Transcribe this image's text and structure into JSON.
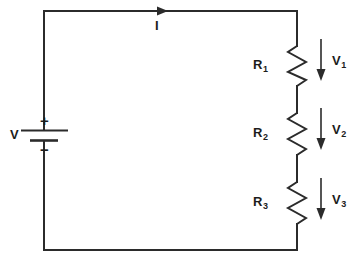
{
  "diagram": {
    "type": "series-resistor-circuit",
    "stroke_color": "#2b2b2b",
    "background": "#ffffff",
    "source": {
      "label": "V",
      "plus_sign": "+",
      "minus_sign": "−",
      "symbol": "battery-cell"
    },
    "current": {
      "label": "I",
      "direction": "right",
      "arrow": "current-arrow-right"
    },
    "components": [
      {
        "label": "R",
        "subscript": "1",
        "type": "resistor"
      },
      {
        "label": "R",
        "subscript": "2",
        "type": "resistor"
      },
      {
        "label": "R",
        "subscript": "3",
        "type": "resistor"
      }
    ],
    "voltage_drops": [
      {
        "label": "V",
        "subscript": "1",
        "direction": "down",
        "arrow": "voltage-arrow-down"
      },
      {
        "label": "V",
        "subscript": "2",
        "direction": "down",
        "arrow": "voltage-arrow-down"
      },
      {
        "label": "V",
        "subscript": "3",
        "direction": "down",
        "arrow": "voltage-arrow-down"
      }
    ]
  }
}
